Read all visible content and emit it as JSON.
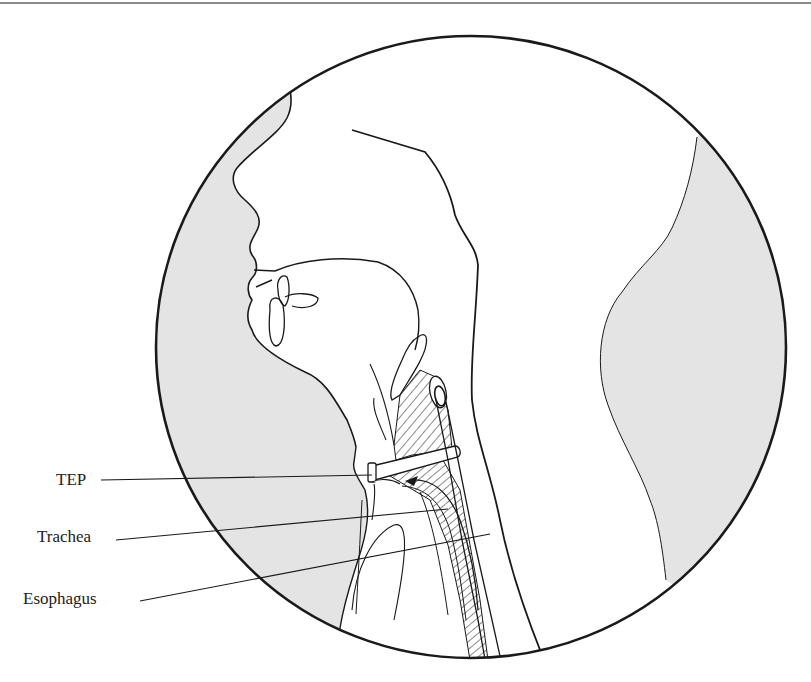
{
  "figure": {
    "labels": {
      "tep": "TEP",
      "trachea": "Trachea",
      "esophagus": "Esophagus"
    },
    "colors": {
      "outline": "#1a1a1a",
      "shaded_background": "#e4e4e4",
      "label_text": "#222222",
      "bleed_through_text": "#d4d4d4"
    }
  },
  "bleed_through": {
    "left_lines": [
      "",
      "",
      "",
      "",
      "",
      ""
    ]
  }
}
